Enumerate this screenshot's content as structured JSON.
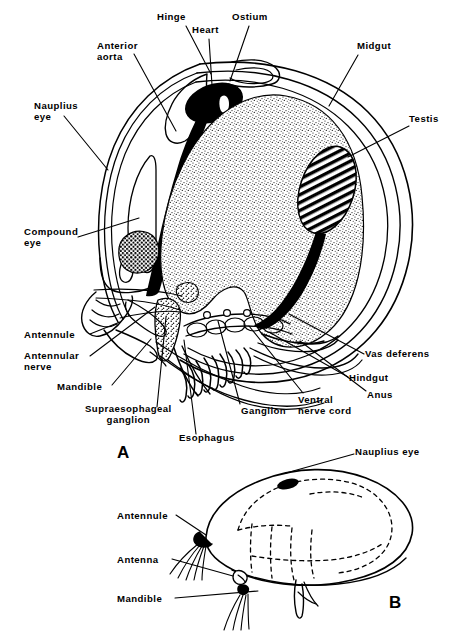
{
  "figure": {
    "title_visible": false,
    "background_color": "#ffffff",
    "ink_color": "#000000",
    "panels": [
      {
        "id": "A",
        "label": "A",
        "x": 117,
        "y": 444,
        "description": "sagittal section of ostracod showing internal anatomy"
      },
      {
        "id": "B",
        "label": "B",
        "x": 389,
        "y": 594,
        "description": "external lateral view of ostracod with dashed internal outlines"
      }
    ]
  },
  "panel_a": {
    "labels": [
      {
        "name": "hinge",
        "text": "Hinge",
        "x": 157,
        "y": 14,
        "align": "left",
        "leader": [
          [
            186,
            26
          ],
          [
            211,
            74
          ]
        ]
      },
      {
        "name": "heart",
        "text": "Heart",
        "x": 192,
        "y": 27,
        "align": "left",
        "leader": [
          [
            210,
            39
          ],
          [
            212,
            85
          ]
        ]
      },
      {
        "name": "ostium",
        "text": "Ostium",
        "x": 232,
        "y": 14,
        "align": "left",
        "leader": [
          [
            249,
            26
          ],
          [
            230,
            81
          ]
        ]
      },
      {
        "name": "anterior-aorta",
        "text": "Anterior\naorta",
        "x": 98,
        "y": 41,
        "align": "left",
        "leader": [
          [
            134,
            54
          ],
          [
            176,
            131
          ]
        ]
      },
      {
        "name": "midgut",
        "text": "Midgut",
        "x": 357,
        "y": 41,
        "align": "left",
        "leader": [
          [
            358,
            52
          ],
          [
            329,
            106
          ]
        ]
      },
      {
        "name": "nauplius-eye",
        "text": "Nauplius\neye",
        "x": 35,
        "y": 102,
        "align": "left",
        "leader": [
          [
            64,
            113
          ],
          [
            108,
            170
          ]
        ]
      },
      {
        "name": "testis",
        "text": "Testis",
        "x": 410,
        "y": 114,
        "align": "left",
        "leader": [
          [
            409,
            123
          ],
          [
            348,
            157
          ]
        ]
      },
      {
        "name": "compound-eye",
        "text": "Compound\neye",
        "x": 25,
        "y": 228,
        "align": "left",
        "leader": [
          [
            78,
            235
          ],
          [
            139,
            218
          ]
        ]
      },
      {
        "name": "antennule",
        "text": "Antennule",
        "x": 25,
        "y": 330,
        "align": "left",
        "leader": [
          [
            90,
            334
          ],
          [
            120,
            322
          ]
        ]
      },
      {
        "name": "antennular-nerve",
        "text": "Antennular\nnerve",
        "x": 25,
        "y": 352,
        "align": "left",
        "leader": [
          [
            90,
            356
          ],
          [
            155,
            307
          ]
        ]
      },
      {
        "name": "mandible",
        "text": "Mandible",
        "x": 58,
        "y": 383,
        "align": "left",
        "leader": [
          [
            110,
            386
          ],
          [
            151,
            339
          ]
        ]
      },
      {
        "name": "supraesophageal-ganglion",
        "text": "Supraesophageal\nganglion",
        "x": 86,
        "y": 409,
        "align": "left",
        "leader": [
          [
            155,
            409
          ],
          [
            166,
            317
          ]
        ]
      },
      {
        "name": "esophagus",
        "text": "Esophagus",
        "x": 180,
        "y": 437,
        "align": "left",
        "leader": [
          [
            196,
            436
          ],
          [
            184,
            340
          ]
        ]
      },
      {
        "name": "ganglion",
        "text": "Ganglion",
        "x": 241,
        "y": 407,
        "align": "left",
        "leader": [
          [
            240,
            404
          ],
          [
            218,
            321
          ]
        ]
      },
      {
        "name": "ventral-nerve-cord",
        "text": "Ventral\nnerve cord",
        "x": 299,
        "y": 396,
        "align": "left",
        "leader": [
          [
            303,
            395
          ],
          [
            249,
            326
          ]
        ]
      },
      {
        "name": "vas-deferens",
        "text": "Vas deferens",
        "x": 366,
        "y": 350,
        "align": "left",
        "leader": [
          [
            364,
            354
          ],
          [
            289,
            314
          ]
        ]
      },
      {
        "name": "hindgut",
        "text": "Hindgut",
        "x": 350,
        "y": 374,
        "align": "left",
        "leader": [
          [
            348,
            377
          ],
          [
            269,
            330
          ]
        ]
      },
      {
        "name": "anus",
        "text": "Anus",
        "x": 368,
        "y": 392,
        "align": "left",
        "leader": [
          [
            366,
            392
          ],
          [
            300,
            340
          ]
        ]
      }
    ]
  },
  "panel_b": {
    "labels": [
      {
        "name": "nauplius-eye",
        "text": "Nauplius eye",
        "x": 355,
        "y": 448,
        "align": "left",
        "leader": [
          [
            354,
            455
          ],
          [
            286,
            472
          ]
        ]
      },
      {
        "name": "antennule",
        "text": "Antennule",
        "x": 118,
        "y": 512,
        "align": "left",
        "leader": [
          [
            176,
            517
          ],
          [
            206,
            537
          ]
        ]
      },
      {
        "name": "antenna",
        "text": "Antenna",
        "x": 118,
        "y": 556,
        "align": "left",
        "leader": [
          [
            172,
            560
          ],
          [
            233,
            576
          ]
        ]
      },
      {
        "name": "mandible",
        "text": "Mandible",
        "x": 118,
        "y": 595,
        "align": "left",
        "leader": [
          [
            175,
            598
          ],
          [
            260,
            591
          ]
        ]
      }
    ]
  },
  "structures": {
    "heart": {
      "fill": "#000000",
      "shape": "solid black oval"
    },
    "ostium": {
      "fill": "#ffffff",
      "shape": "white slit inside heart"
    },
    "anterior_aorta": {
      "fill": "#000000",
      "shape": "thick tapering black tube"
    },
    "midgut": {
      "fill": "stipple",
      "shape": "large stippled mass"
    },
    "testis": {
      "fill": "hatch",
      "shape": "diagonally hatched oval"
    },
    "compound_eye": {
      "fill": "coarse-stipple",
      "shape": "dark dotted blob"
    },
    "supraesophageal_ganglion": {
      "fill": "stipple",
      "shape": "small stippled wedge"
    },
    "carapace": {
      "fill": "none",
      "shape": "concentric outline valves"
    },
    "nauplius_eye_b": {
      "fill": "#000000",
      "shape": "small black oval"
    }
  }
}
